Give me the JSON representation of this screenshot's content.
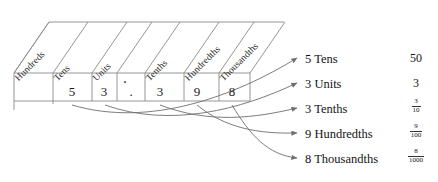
{
  "diagram": {
    "type": "place-value-chart",
    "number": "53.398"
  },
  "chart": {
    "columns": [
      {
        "header": "Hundreds",
        "digit": ""
      },
      {
        "header": "Tens",
        "digit": "5"
      },
      {
        "header": "Units",
        "digit": "3"
      },
      {
        "header": ".",
        "digit": "."
      },
      {
        "header": "Tenths",
        "digit": "3"
      },
      {
        "header": "Hundredths",
        "digit": "9"
      },
      {
        "header": "Thousandths",
        "digit": "8"
      }
    ]
  },
  "legend": {
    "rows": [
      {
        "label": "5 Tens",
        "value": "50",
        "value_type": "integer"
      },
      {
        "label": "3 Units",
        "value": "3",
        "value_type": "integer"
      },
      {
        "label": "3 Tenths",
        "value_type": "fraction",
        "numerator": "3",
        "denominator": "10"
      },
      {
        "label": "9 Hundredths",
        "value_type": "fraction",
        "numerator": "9",
        "denominator": "100"
      },
      {
        "label": "8 Thousandths",
        "value_type": "fraction",
        "numerator": "8",
        "denominator": "1000"
      }
    ]
  },
  "colors": {
    "line": "#8a8a8a",
    "text": "#141414",
    "background": "#ffffff"
  }
}
